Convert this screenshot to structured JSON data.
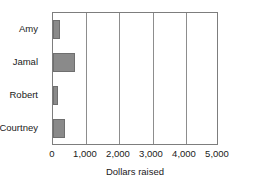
{
  "chart_data": {
    "type": "bar",
    "orientation": "horizontal",
    "title": "",
    "xlabel": "Dollars raised",
    "ylabel": "",
    "categories": [
      "Amy",
      "Jamal",
      "Robert",
      "Courtney"
    ],
    "values": [
      220,
      650,
      150,
      370
    ],
    "xlim": [
      0,
      5000
    ],
    "xticks": [
      0,
      1000,
      2000,
      3000,
      4000,
      5000
    ],
    "xtick_labels": [
      "0",
      "1,000",
      "2,000",
      "3,000",
      "4,000",
      "5,000"
    ],
    "grid": true,
    "grid_axis": "x",
    "legend": false,
    "bar_color": "#8a8a8a",
    "bar_edge_color": "#6f6f6f",
    "frame_color": "#7d7d7d",
    "text_color": "#1a1a1a"
  }
}
